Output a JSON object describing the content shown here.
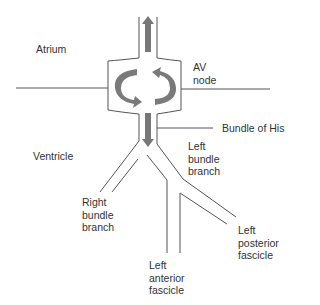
{
  "diagram": {
    "colors": {
      "line": "#555555",
      "arrow": "#7a7a7a",
      "text": "#333333"
    },
    "labels": {
      "atrium": "Atrium",
      "av_node": "AV\nnode",
      "ventricle": "Ventricle",
      "bundle_of_his": "Bundle of His",
      "left_bundle_branch": "Left\nbundle\nbranch",
      "right_bundle_branch": "Right\nbundle\nbranch",
      "left_posterior_fascicle": "Left\nposterior\nfascicle",
      "left_anterior_fascicle": "Left\nanterior\nfascicle"
    },
    "arrows": [
      "up-arrow",
      "down-arrow",
      "circular-arrow-left",
      "circular-arrow-right"
    ]
  }
}
